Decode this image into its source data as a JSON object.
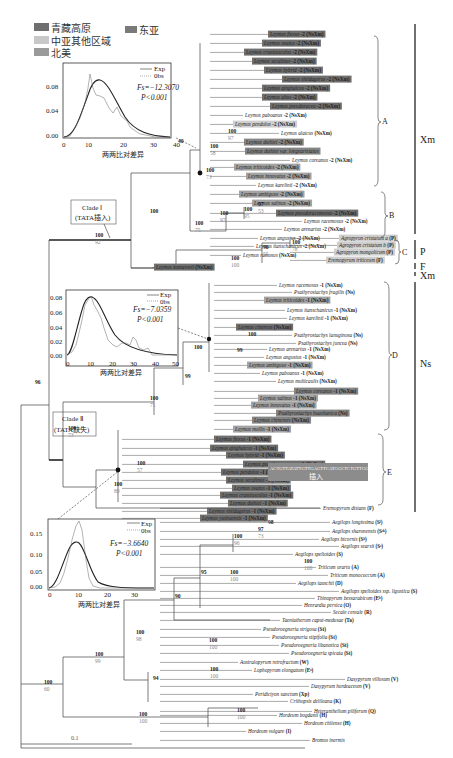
{
  "legend": {
    "items": [
      {
        "label": "青藏高原",
        "color": "#6f6f6f"
      },
      {
        "label": "东亚",
        "color": "#7a7a7a"
      },
      {
        "label": "中亚其他区域",
        "color": "#c8c8c8"
      },
      {
        "label": "北美",
        "color": "#9a9a9a"
      }
    ]
  },
  "colors": {
    "tibet": "#6f6f6f",
    "east_asia": "#858585",
    "central_asia": "#cfcfcf",
    "north_america": "#a3a3a3",
    "line": "#333333",
    "support_secondary": "#888888"
  },
  "insets": [
    {
      "id": "inset-1",
      "legend_exp": "Exp",
      "legend_obs": "0bs",
      "fs": "Fs=−12.3070",
      "p": "P<0.001",
      "y_ticks": [
        "0.08",
        "0.04",
        "0.00"
      ],
      "x_ticks": [
        "0",
        "10",
        "20",
        "30",
        "40"
      ],
      "xlabel": "两两比对差异"
    },
    {
      "id": "inset-2",
      "legend_exp": "Exp",
      "legend_obs": "0bs",
      "fs": "Fs=−7.0359",
      "p": "P<0.001",
      "y_ticks": [
        "0.08",
        "0.06",
        "0.04",
        "0.02",
        "0.00"
      ],
      "x_ticks": [
        "0",
        "10",
        "20",
        "30",
        "40",
        "50"
      ],
      "xlabel": "两两比对差异"
    },
    {
      "id": "inset-3",
      "legend_exp": "Exp",
      "legend_obs": "0bs",
      "fs": "Fs=−3.6640",
      "p": "P<0.001",
      "y_ticks": [
        "0.15",
        "0.10",
        "0.05",
        "0.00"
      ],
      "x_ticks": [
        "0",
        "10",
        "20",
        "30"
      ],
      "xlabel": "两两比对差异"
    }
  ],
  "clade_boxes": {
    "clade1": {
      "line1": "Clade Ⅰ",
      "line2": "(TATA插入)"
    },
    "clade2": {
      "line1": "Clade Ⅱ",
      "line2": "(TATA缺失)"
    }
  },
  "insertion": {
    "sequence": "ACTGTTATATTGTTGAGTTCATGGCTCTGTTGG",
    "label": "插入"
  },
  "subclades": [
    "A",
    "B",
    "C",
    "D",
    "E"
  ],
  "genomes": [
    "Xm",
    "P",
    "F",
    "Xm",
    "Ns"
  ],
  "scale_bar": "0.1",
  "taxa": [
    {
      "name": "Leymus flexus",
      "suffix": "-2 (NsXm)",
      "bg": "tibet"
    },
    {
      "name": "Leymus ovatus",
      "suffix": "-2 (NsXm)",
      "bg": "tibet"
    },
    {
      "name": "Leymus crassiusculus",
      "suffix": "-2 (NsXm)",
      "bg": "tibet"
    },
    {
      "name": "Leymus secalinus",
      "suffix": "-2 (NsXm)",
      "bg": "tibet"
    },
    {
      "name": "Leymus hybrid",
      "suffix": "-2 (NsXm)",
      "bg": "tibet"
    },
    {
      "name": "Leymus shiidagerus",
      "suffix": "-2 (NsXm)",
      "bg": "tibet"
    },
    {
      "name": "Leymus qinghaicus",
      "suffix": "-2 (NsXm)",
      "bg": "tibet"
    },
    {
      "name": "Leymus altus",
      "suffix": "-2 (NsXm)",
      "bg": "tibet"
    },
    {
      "name": "Leymus pseudoraceu",
      "suffix": "-2 (NsXm)",
      "bg": "tibet"
    },
    {
      "name": "Leymus paboanus",
      "suffix": "-2 (NsXm)",
      "bg": "none"
    },
    {
      "name": "Leymus pendulus",
      "suffix": "-2 (NsXm)",
      "bg": "central_asia"
    },
    {
      "name": "Leymus alaicus",
      "suffix": "(NsXm)",
      "bg": "none"
    },
    {
      "name": "Leymus duthiei",
      "suffix": "-2 (NsXm)",
      "bg": "east_asia"
    },
    {
      "name": "Leymus duthiei var. longearistatus",
      "suffix": "",
      "bg": "east_asia"
    },
    {
      "name": "Leymus coreanus",
      "suffix": "-2 (NsXm)",
      "bg": "none"
    },
    {
      "name": "Leymus triticoides",
      "suffix": "-2 (NsXm)",
      "bg": "north_america"
    },
    {
      "name": "Leymus innovatus",
      "suffix": "-2 (NsXm)",
      "bg": "north_america"
    },
    {
      "name": "Leymus karelinii",
      "suffix": "-2 (NsXm)",
      "bg": "none"
    },
    {
      "name": "Leymus ambiguus",
      "suffix": "-2 (NsXm)",
      "bg": "north_america"
    },
    {
      "name": "Leymus salinus",
      "suffix": "-2 (NsXm)",
      "bg": "north_america"
    },
    {
      "name": "Leymus pseudoracemosus",
      "suffix": "-2 (NsXm)",
      "bg": "tibet"
    },
    {
      "name": "Leymus racemosus",
      "suffix": "-2 (NsXm)",
      "bg": "none"
    },
    {
      "name": "Leymus arenarius",
      "suffix": "-2 (NsXm)",
      "bg": "none"
    },
    {
      "name": "Leymus angustus",
      "suffix": "-2 (NsXm)",
      "bg": "none"
    },
    {
      "name": "Leymus tianschanicus",
      "suffix": "-2 (NsXm)",
      "bg": "none"
    },
    {
      "name": "Leymus ramosus",
      "suffix": "(NsXm)",
      "bg": "none"
    },
    {
      "name": "Agropyron cristatum a",
      "suffix": "(P)",
      "bg": "central_asia"
    },
    {
      "name": "Agropyron cristatum b",
      "suffix": "(P)",
      "bg": "central_asia"
    },
    {
      "name": "Agropyron mongolicum",
      "suffix": "(P)",
      "bg": "central_asia"
    },
    {
      "name": "Eremopyrum triticeum",
      "suffix": "(F)",
      "bg": "central_asia"
    },
    {
      "name": "Leymus komarovii",
      "suffix": "(NsXm)",
      "bg": "tibet"
    },
    {
      "name": "Leymus racemosus",
      "suffix": "-1 (NsXm)",
      "bg": "none"
    },
    {
      "name": "Psathyrostachys fragilis",
      "suffix": "(Ns)",
      "bg": "none"
    },
    {
      "name": "Leymus triticoides",
      "suffix": "-1 (NsXm)",
      "bg": "north_america"
    },
    {
      "name": "Leymus tianschanicus",
      "suffix": "-1 (NsXm)",
      "bg": "none"
    },
    {
      "name": "Leymus karelinii",
      "suffix": "-1 (NsXm)",
      "bg": "none"
    },
    {
      "name": "Leymus cinereus",
      "suffix": "(NsXm)",
      "bg": "tibet"
    },
    {
      "name": "Psathyrostachys lanuginosa",
      "suffix": "(Ns)",
      "bg": "none"
    },
    {
      "name": "Psathyrostachys juncea",
      "suffix": "(Ns)",
      "bg": "none"
    },
    {
      "name": "Leymus arenarius",
      "suffix": "-1 (NsXm)",
      "bg": "none"
    },
    {
      "name": "Leymus angustus",
      "suffix": "-1 (NsXm)",
      "bg": "none"
    },
    {
      "name": "Leymus ambiguus",
      "suffix": "-1 (NsXm)",
      "bg": "north_america"
    },
    {
      "name": "Leymus paboanus",
      "suffix": "-1 (NsXm)",
      "bg": "none"
    },
    {
      "name": "Leymus multicaulis",
      "suffix": "(NsXm)",
      "bg": "none"
    },
    {
      "name": "Leymus coreanus",
      "suffix": "-1 (NsXm)",
      "bg": "east_asia"
    },
    {
      "name": "Leymus salinus",
      "suffix": "-1 (NsXm)",
      "bg": "north_america"
    },
    {
      "name": "Leymus innovatus",
      "suffix": "-1 (NsXm)",
      "bg": "north_america"
    },
    {
      "name": "Psathyrostachys huashanica",
      "suffix": "(Ns)",
      "bg": "east_asia"
    },
    {
      "name": "Leymus chinensis",
      "suffix": "(NsXm)",
      "bg": "east_asia"
    },
    {
      "name": "Leymus mollis",
      "suffix": "-1 (NsXm)",
      "bg": "north_america"
    },
    {
      "name": "Leymus flexus",
      "suffix": "-1 (NsXm)",
      "bg": "tibet"
    },
    {
      "name": "Leymus qinghaicus",
      "suffix": "-1 (NsXm)",
      "bg": "tibet"
    },
    {
      "name": "Leymus hybrid",
      "suffix": "-1 (NsXm)",
      "bg": "tibet"
    },
    {
      "name": "Leymus pseudoracemosus",
      "suffix": "-1 (NsXm)",
      "bg": "tibet"
    },
    {
      "name": "Leymus pendulus",
      "suffix": "-1 (NsXm)",
      "bg": "tibet"
    },
    {
      "name": "Leymus secalinus",
      "suffix": "-1 (NsXm)",
      "bg": "tibet"
    },
    {
      "name": "Leymus ovatus",
      "suffix": "-1 (NsXm)",
      "bg": "tibet"
    },
    {
      "name": "Leymus crassiusculus",
      "suffix": "-1 (NsXm)",
      "bg": "tibet"
    },
    {
      "name": "Leymus duthiei",
      "suffix": "-1 (NsXm)",
      "bg": "tibet"
    },
    {
      "name": "Leymus shiidagerus",
      "suffix": "-1 (NsXm)",
      "bg": "tibet"
    },
    {
      "name": "Leymus yushuensis",
      "suffix": "-1 (NsXm)",
      "bg": "tibet"
    },
    {
      "name": "Eremopyrum distans",
      "suffix": "(F)",
      "bg": "none"
    },
    {
      "name": "Aegilops longissima",
      "suffix": "(Sˡ)",
      "bg": "none"
    },
    {
      "name": "Aegilops sharonensis",
      "suffix": "(Sˢʰ)",
      "bg": "none"
    },
    {
      "name": "Aegilops bicornis",
      "suffix": "(Sᵇ)",
      "bg": "none"
    },
    {
      "name": "Aegilops searsii",
      "suffix": "(Sˢ)",
      "bg": "none"
    },
    {
      "name": "Aegilops speltoides",
      "suffix": "(S)",
      "bg": "none"
    },
    {
      "name": "Triticum urartu",
      "suffix": "(A)",
      "bg": "none"
    },
    {
      "name": "Triticum monococcum",
      "suffix": "(A)",
      "bg": "none"
    },
    {
      "name": "Aegilops tauschii",
      "suffix": "(D)",
      "bg": "none"
    },
    {
      "name": "Aegilops speltoides ssp. ligustica",
      "suffix": "(S)",
      "bg": "none"
    },
    {
      "name": "Thinopyrum bessarabicum",
      "suffix": "(Eᵇ)",
      "bg": "none"
    },
    {
      "name": "Henrardia persica",
      "suffix": "(O)",
      "bg": "none"
    },
    {
      "name": "Secale cereale",
      "suffix": "(R)",
      "bg": "none"
    },
    {
      "name": "Taeniatherum caput-medusae",
      "suffix": "(Ta)",
      "bg": "none"
    },
    {
      "name": "Pseudoroegneria strigosa",
      "suffix": "(St)",
      "bg": "none"
    },
    {
      "name": "Pseudoroegneria stipifolia",
      "suffix": "(St)",
      "bg": "none"
    },
    {
      "name": "Pseudoroegneria libanotica",
      "suffix": "(St)",
      "bg": "none"
    },
    {
      "name": "Pseudoroegneria spicata",
      "suffix": "(St)",
      "bg": "none"
    },
    {
      "name": "Australopyrum retrofractum",
      "suffix": "(W)",
      "bg": "none"
    },
    {
      "name": "Lophopyrum elongatum",
      "suffix": "(Eᵉ)",
      "bg": "none"
    },
    {
      "name": "Dasypyrum villosum",
      "suffix": "(V)",
      "bg": "none"
    },
    {
      "name": "Dasypyrum hordeaceum",
      "suffix": "(V)",
      "bg": "none"
    },
    {
      "name": "Peridictyon sanctum",
      "suffix": "(Xp)",
      "bg": "none"
    },
    {
      "name": "Crithopsis delileana",
      "suffix": "(K)",
      "bg": "none"
    },
    {
      "name": "Heteranthelium piliferum",
      "suffix": "(Q)",
      "bg": "none"
    },
    {
      "name": "Hordeum bogdanii",
      "suffix": "(H)",
      "bg": "none"
    },
    {
      "name": "Hordeum chilense",
      "suffix": "(H)",
      "bg": "none"
    },
    {
      "name": "Hordeum vulgare",
      "suffix": "(I)",
      "bg": "none"
    },
    {
      "name": "Bromus inermis",
      "suffix": "",
      "bg": "none"
    }
  ],
  "supports": [
    {
      "x": 228,
      "y": 133,
      "top": "100",
      "bot": "97"
    },
    {
      "x": 206,
      "y": 172,
      "top": "100",
      "bot": "73"
    },
    {
      "x": 210,
      "y": 148,
      "top": "100",
      "bot": "58"
    },
    {
      "x": 258,
      "y": 206,
      "top": "97",
      "bot": "53"
    },
    {
      "x": 244,
      "y": 211,
      "top": "100",
      "bot": "95"
    },
    {
      "x": 220,
      "y": 215,
      "top": "100",
      "bot": "97"
    },
    {
      "x": 195,
      "y": 225,
      "top": "100",
      "bot": "75"
    },
    {
      "x": 150,
      "y": 213,
      "top": "100",
      "bot": ""
    },
    {
      "x": 95,
      "y": 237,
      "top": "100",
      "bot": "92"
    },
    {
      "x": 263,
      "y": 249,
      "top": "90",
      "bot": "55"
    },
    {
      "x": 292,
      "y": 244,
      "top": "100",
      "bot": "78"
    },
    {
      "x": 231,
      "y": 260,
      "top": "100",
      "bot": "100"
    },
    {
      "x": 248,
      "y": 336,
      "top": "100",
      "bot": ""
    },
    {
      "x": 237,
      "y": 352,
      "top": "99",
      "bot": ""
    },
    {
      "x": 194,
      "y": 349,
      "top": "100",
      "bot": ""
    },
    {
      "x": 185,
      "y": 378,
      "top": "99",
      "bot": ""
    },
    {
      "x": 150,
      "y": 400,
      "top": "100",
      "bot": "71"
    },
    {
      "x": 68,
      "y": 430,
      "top": "100",
      "bot": "73"
    },
    {
      "x": 137,
      "y": 465,
      "top": "100",
      "bot": "57"
    },
    {
      "x": 114,
      "y": 486,
      "top": "100",
      "bot": "80"
    },
    {
      "x": 35,
      "y": 384,
      "top": "96",
      "bot": ""
    },
    {
      "x": 268,
      "y": 524,
      "top": "98",
      "bot": ""
    },
    {
      "x": 258,
      "y": 531,
      "top": "97",
      "bot": "73"
    },
    {
      "x": 234,
      "y": 538,
      "top": "100",
      "bot": "96"
    },
    {
      "x": 304,
      "y": 563,
      "top": "100",
      "bot": "100"
    },
    {
      "x": 230,
      "y": 574,
      "top": "100",
      "bot": "100"
    },
    {
      "x": 201,
      "y": 574,
      "top": "95",
      "bot": ""
    },
    {
      "x": 175,
      "y": 598,
      "top": "90",
      "bot": ""
    },
    {
      "x": 136,
      "y": 634,
      "top": "100",
      "bot": "98"
    },
    {
      "x": 209,
      "y": 642,
      "top": "100",
      "bot": "100"
    },
    {
      "x": 153,
      "y": 680,
      "top": "94",
      "bot": ""
    },
    {
      "x": 210,
      "y": 671,
      "top": "100",
      "bot": "100"
    },
    {
      "x": 95,
      "y": 656,
      "top": "100",
      "bot": "99"
    },
    {
      "x": 44,
      "y": 684,
      "top": "100",
      "bot": "60"
    },
    {
      "x": 237,
      "y": 712,
      "top": "100",
      "bot": "100"
    },
    {
      "x": 139,
      "y": 716,
      "top": "100",
      "bot": "100"
    }
  ]
}
